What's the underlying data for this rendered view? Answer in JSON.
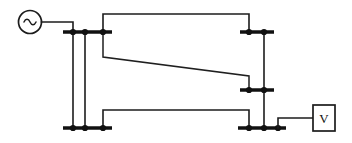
{
  "diagram": {
    "kind": "single-line-power-system-schematic",
    "canvas": {
      "width": 352,
      "height": 143,
      "background": "#ffffff"
    },
    "stroke_color": "#1c1c1c",
    "busbar_color": "#111111",
    "source": {
      "label": "~",
      "icon": "ac-source-icon",
      "cx": 30,
      "cy": 22,
      "r": 11.5,
      "lead": "M 41.5 22 L 73 22 L 73 32"
    },
    "meter": {
      "label": "V",
      "x": 313,
      "y": 105,
      "width": 22,
      "height": 26,
      "lead": "M 313 118 L 278 118 L 278 128"
    },
    "busbars": [
      {
        "name": "bus-left-top",
        "x1": 63,
        "x2": 112,
        "y": 32
      },
      {
        "name": "bus-left-bottom",
        "x1": 63,
        "x2": 112,
        "y": 128
      },
      {
        "name": "bus-right-top",
        "x1": 240,
        "x2": 274,
        "y": 32
      },
      {
        "name": "bus-right-mid",
        "x1": 240,
        "x2": 274,
        "y": 90
      },
      {
        "name": "bus-right-bottom",
        "x1": 238,
        "x2": 286,
        "y": 128
      }
    ],
    "nodes": [
      {
        "name": "node-left-top-1",
        "cx": 73,
        "cy": 32,
        "r": 3.1
      },
      {
        "name": "node-left-top-2",
        "cx": 85,
        "cy": 32,
        "r": 3.1
      },
      {
        "name": "node-left-top-3",
        "cx": 103,
        "cy": 32,
        "r": 3.1
      },
      {
        "name": "node-left-bottom-1",
        "cx": 73,
        "cy": 128,
        "r": 3.1
      },
      {
        "name": "node-left-bottom-2",
        "cx": 85,
        "cy": 128,
        "r": 3.1
      },
      {
        "name": "node-left-bottom-3",
        "cx": 103,
        "cy": 128,
        "r": 3.1
      },
      {
        "name": "node-right-top-1",
        "cx": 249,
        "cy": 32,
        "r": 3.1
      },
      {
        "name": "node-right-top-2",
        "cx": 264,
        "cy": 32,
        "r": 3.1
      },
      {
        "name": "node-right-mid-1",
        "cx": 249,
        "cy": 90,
        "r": 3.1
      },
      {
        "name": "node-right-mid-2",
        "cx": 264,
        "cy": 90,
        "r": 3.1
      },
      {
        "name": "node-right-bottom-1",
        "cx": 249,
        "cy": 128,
        "r": 3.1
      },
      {
        "name": "node-right-bottom-2",
        "cx": 264,
        "cy": 128,
        "r": 3.1
      },
      {
        "name": "node-right-bottom-3",
        "cx": 278,
        "cy": 128,
        "r": 3.1
      }
    ],
    "feeders": [
      {
        "name": "feeder-left-a",
        "path": "M 73 32 L 73 128"
      },
      {
        "name": "feeder-left-b",
        "path": "M 85 32 L 85 128"
      },
      {
        "name": "feeder-right-tie",
        "path": "M 264 32 L 264 128"
      }
    ],
    "lines": [
      {
        "name": "transmission-line-top",
        "path": "M 103 32 L 103 14 L 249 14 L 249 32"
      },
      {
        "name": "transmission-line-diagonal",
        "path": "M 103 32 L 103 57 L 249 76 L 249 90"
      },
      {
        "name": "transmission-line-bottom",
        "path": "M 103 128 L 103 110 L 249 110 L 249 128"
      }
    ]
  }
}
